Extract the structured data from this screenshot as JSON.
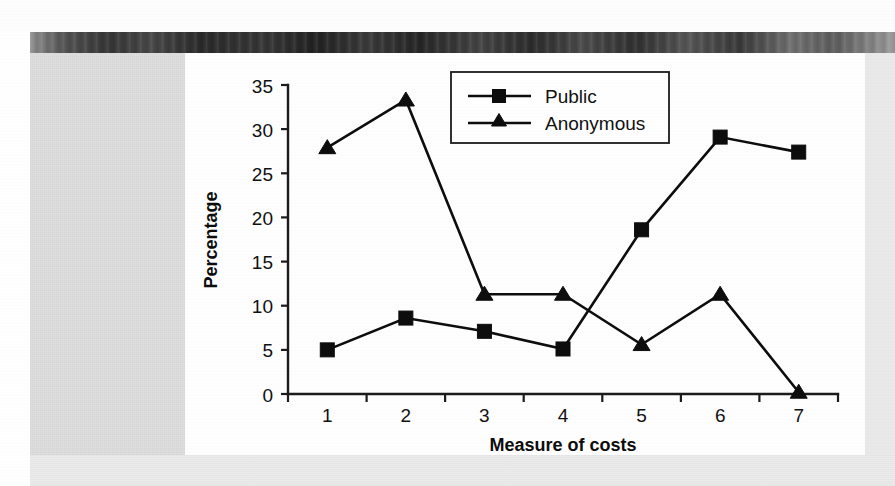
{
  "figure": {
    "background_color": "#fefefe",
    "page_gutter_color": "#e3e3e3",
    "ink_color": "#0d0d0d"
  },
  "chart_data": {
    "type": "line",
    "title": "",
    "xlabel": "Measure of costs",
    "ylabel": "Percentage",
    "categories": [
      "1",
      "2",
      "3",
      "4",
      "5",
      "6",
      "7"
    ],
    "x": [
      1,
      2,
      3,
      4,
      5,
      6,
      7
    ],
    "xtick_labels": [
      "1",
      "2",
      "3",
      "4",
      "5",
      "6",
      "7"
    ],
    "ytick_labels": [
      "0",
      "5",
      "10",
      "15",
      "20",
      "25",
      "30",
      "35"
    ],
    "ytick_values": [
      0,
      5,
      10,
      15,
      20,
      25,
      30,
      35
    ],
    "ylim": [
      0,
      35
    ],
    "xlim": [
      0.5,
      7.5
    ],
    "grid": false,
    "legend_position": "top-right",
    "series": [
      {
        "name": "Public",
        "marker": "square",
        "values": [
          5.0,
          8.6,
          7.1,
          5.1,
          18.6,
          29.1,
          27.4
        ]
      },
      {
        "name": "Anonymous",
        "marker": "triangle",
        "values": [
          27.9,
          33.3,
          11.3,
          11.3,
          5.6,
          11.3,
          0.2
        ]
      }
    ]
  },
  "legend": {
    "entries": [
      {
        "label": "Public",
        "marker": "square-marker"
      },
      {
        "label": "Anonymous",
        "marker": "triangle-marker"
      }
    ]
  },
  "icons": {
    "square_marker": "square-marker-icon",
    "triangle_marker": "triangle-marker-icon"
  }
}
